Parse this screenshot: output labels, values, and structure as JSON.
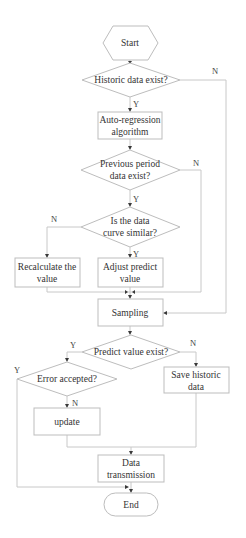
{
  "diagram": {
    "type": "flowchart",
    "nodes": {
      "start": {
        "label": "Start",
        "shape": "hexagon"
      },
      "historic_exist": {
        "label": "Historic data exist?",
        "shape": "diamond"
      },
      "auto_regression": {
        "line1": "Auto-regression",
        "line2": "algorithm",
        "shape": "rect"
      },
      "previous_exist": {
        "line1": "Previous period",
        "line2": "data exist?",
        "shape": "diamond"
      },
      "curve_similar": {
        "line1": "Is the data",
        "line2": "curve similar?",
        "shape": "diamond"
      },
      "recalculate": {
        "line1": "Recalculate the",
        "line2": "value",
        "shape": "rect"
      },
      "adjust": {
        "line1": "Adjust predict",
        "line2": "value",
        "shape": "rect"
      },
      "sampling": {
        "label": "Sampling",
        "shape": "rect"
      },
      "predict_exist": {
        "label": "Predict value exist?",
        "shape": "diamond"
      },
      "error_accepted": {
        "label": "Error accepted?",
        "shape": "diamond"
      },
      "save_historic": {
        "line1": "Save historic",
        "line2": "data",
        "shape": "rect"
      },
      "update": {
        "label": "update",
        "shape": "rect"
      },
      "transmission": {
        "line1": "Data",
        "line2": "transmission",
        "shape": "rect"
      },
      "end": {
        "label": "End",
        "shape": "terminator"
      }
    },
    "edge_labels": {
      "historic_no": "N",
      "historic_yes": "Y",
      "previous_no": "N",
      "previous_yes": "Y",
      "curve_no": "N",
      "curve_yes": "Y",
      "predict_yes": "Y",
      "predict_no": "N",
      "error_yes": "Y",
      "error_no": "N"
    },
    "edges": [
      [
        "start",
        "historic_exist"
      ],
      [
        "historic_exist",
        "auto_regression",
        "Y"
      ],
      [
        "historic_exist",
        "sampling",
        "N"
      ],
      [
        "auto_regression",
        "previous_exist"
      ],
      [
        "previous_exist",
        "curve_similar",
        "Y"
      ],
      [
        "previous_exist",
        "sampling",
        "N"
      ],
      [
        "curve_similar",
        "adjust",
        "Y"
      ],
      [
        "curve_similar",
        "recalculate",
        "N"
      ],
      [
        "recalculate",
        "sampling"
      ],
      [
        "adjust",
        "sampling"
      ],
      [
        "sampling",
        "predict_exist"
      ],
      [
        "predict_exist",
        "error_accepted",
        "Y"
      ],
      [
        "predict_exist",
        "save_historic",
        "N"
      ],
      [
        "error_accepted",
        "update",
        "N"
      ],
      [
        "error_accepted",
        "end",
        "Y"
      ],
      [
        "update",
        "transmission"
      ],
      [
        "save_historic",
        "transmission"
      ],
      [
        "transmission",
        "end"
      ]
    ]
  }
}
